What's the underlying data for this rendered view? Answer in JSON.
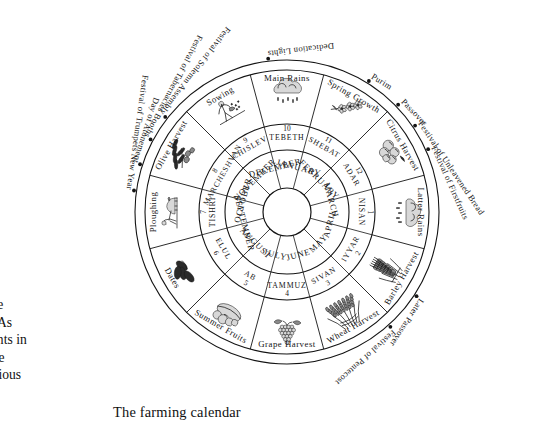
{
  "figure": {
    "caption": "The farming calendar",
    "center": {
      "cx": 287,
      "cy": 212
    },
    "radii": {
      "hub": 24,
      "gregorian_outer": 62,
      "hebrew_outer": 88,
      "activity_outer": 142,
      "festival_arc": 152
    }
  },
  "body_text": {
    "lines": "s the\nne. As\nevents in\nwere\neligious"
  },
  "rings": {
    "gregorian": {
      "ring_name": "gregorian-months",
      "months": [
        {
          "name": "JANUARY",
          "index": 0
        },
        {
          "name": "FEBRUARY",
          "index": 1
        },
        {
          "name": "MARCH",
          "index": 2
        },
        {
          "name": "APRIL",
          "index": 3
        },
        {
          "name": "MAY",
          "index": 4
        },
        {
          "name": "JUNE",
          "index": 5
        },
        {
          "name": "JULY",
          "index": 6
        },
        {
          "name": "AUGUST",
          "index": 7
        },
        {
          "name": "SEPTEMBER",
          "index": 8
        },
        {
          "name": "OCTOBER",
          "index": 9
        },
        {
          "name": "NOVEMBER",
          "index": 10
        },
        {
          "name": "DECEMBER",
          "index": 11
        }
      ]
    },
    "hebrew": {
      "ring_name": "hebrew-months",
      "months": [
        {
          "name": "TEBETH",
          "number": "10",
          "index": 0
        },
        {
          "name": "SHEBAT",
          "number": "11",
          "index": 1
        },
        {
          "name": "ADAR",
          "number": "12",
          "index": 2
        },
        {
          "name": "NISAN",
          "number": "1",
          "index": 3
        },
        {
          "name": "IYYAR",
          "number": "2",
          "index": 4
        },
        {
          "name": "SIVAN",
          "number": "3",
          "index": 5
        },
        {
          "name": "TAMMUZ",
          "number": "4",
          "index": 6
        },
        {
          "name": "AB",
          "number": "5",
          "index": 7
        },
        {
          "name": "ELUL",
          "number": "6",
          "index": 8
        },
        {
          "name": "TISHRI",
          "number": "7",
          "index": 9
        },
        {
          "name": "MARCHESHVAN",
          "number": "8",
          "index": 10
        },
        {
          "name": "CHISLEV",
          "number": "9",
          "index": 11
        }
      ]
    },
    "activities": {
      "ring_name": "farming-activities",
      "items": [
        {
          "label": "Main Rains",
          "icon": "rain-cloud-icon",
          "index": 0
        },
        {
          "label": "Spring Growth",
          "icon": "blossom-branch-icon",
          "index": 1
        },
        {
          "label": "Citrus Harvest",
          "icon": "citrus-fruit-icon",
          "index": 2
        },
        {
          "label": "Latter Rains",
          "icon": "rain-cloud-icon",
          "index": 3
        },
        {
          "label": "Barley Harvest",
          "icon": "barley-sheaf-icon",
          "index": 4
        },
        {
          "label": "Wheat Harvest",
          "icon": "wheat-sheaf-icon",
          "index": 5
        },
        {
          "label": "Grape Harvest",
          "icon": "grape-bunch-icon",
          "index": 6
        },
        {
          "label": "Summer Fruits",
          "icon": "summer-fruit-icon",
          "index": 7
        },
        {
          "label": "Dates",
          "icon": "dates-icon",
          "index": 8
        },
        {
          "label": "Ploughing",
          "icon": "ploughing-oxen-icon",
          "index": 9
        },
        {
          "label": "Olive Harvest",
          "icon": "olive-branch-icon",
          "index": 10
        },
        {
          "label": "Sowing",
          "icon": "sower-icon",
          "index": 11
        }
      ]
    }
  },
  "festivals": [
    {
      "label": "Dedication Lights",
      "angle_deg": -97
    },
    {
      "label": "Festival of Solemn Assembly",
      "angle_deg": -142
    },
    {
      "label": "Festival of Tabernacles  Booths",
      "angle_deg": -152
    },
    {
      "label": "Day of Atonement",
      "angle_deg": -162
    },
    {
      "label": "Festival of Trumpets  New Year",
      "angle_deg": -172
    },
    {
      "label": "Purim",
      "angle_deg": -58
    },
    {
      "label": "Passover",
      "angle_deg": -44
    },
    {
      "label": "Festival of Unleavened Bread",
      "angle_deg": -34
    },
    {
      "label": "Festival of Firstfruits",
      "angle_deg": -24
    },
    {
      "label": "Later Passover",
      "angle_deg": 33
    },
    {
      "label": "Festival of Pentecost",
      "angle_deg": 48
    }
  ]
}
